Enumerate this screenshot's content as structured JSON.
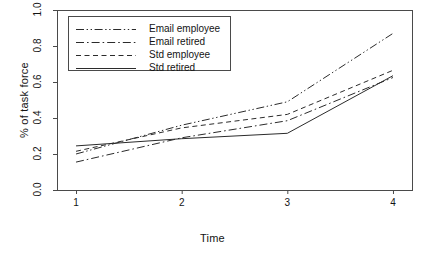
{
  "chart_data": {
    "type": "line",
    "title": "",
    "subtitle": "",
    "xlabel": "Time",
    "ylabel": "% of task force",
    "x": [
      1,
      2,
      3,
      4
    ],
    "xtick_labels": [
      "1",
      "2",
      "3",
      "4"
    ],
    "ytick_labels": [
      "0.0",
      "0.2",
      "0.4",
      "0.6",
      "0.8",
      "1.0"
    ],
    "ytick_values": [
      0.0,
      0.2,
      0.4,
      0.6,
      0.8,
      1.0
    ],
    "xlim": [
      0.82,
      4.18
    ],
    "ylim": [
      0.0,
      1.0
    ],
    "grid": false,
    "legend_position": "top-left",
    "series": [
      {
        "name": "Email employee",
        "line_style": "dash-dot-dot",
        "color": "#2b2b2b",
        "values": [
          0.2,
          0.36,
          0.49,
          0.87
        ]
      },
      {
        "name": "Email retired",
        "line_style": "dash-dot",
        "color": "#2b2b2b",
        "values": [
          0.155,
          0.29,
          0.385,
          0.625
        ]
      },
      {
        "name": "Std employee",
        "line_style": "dashed",
        "color": "#2b2b2b",
        "values": [
          0.215,
          0.345,
          0.42,
          0.665
        ]
      },
      {
        "name": "Std retired",
        "line_style": "solid",
        "color": "#2b2b2b",
        "values": [
          0.245,
          0.285,
          0.315,
          0.635
        ]
      }
    ]
  },
  "legend": {
    "items": [
      {
        "label": "Email employee",
        "style": "dash-dot-dot"
      },
      {
        "label": "Email retired",
        "style": "dash-dot"
      },
      {
        "label": "Std employee",
        "style": "dashed"
      },
      {
        "label": "Std retired",
        "style": "solid"
      }
    ]
  },
  "colors": {
    "axis": "#4a4a4a",
    "line": "#2b2b2b",
    "background": "#ffffff",
    "text": "#141414"
  }
}
